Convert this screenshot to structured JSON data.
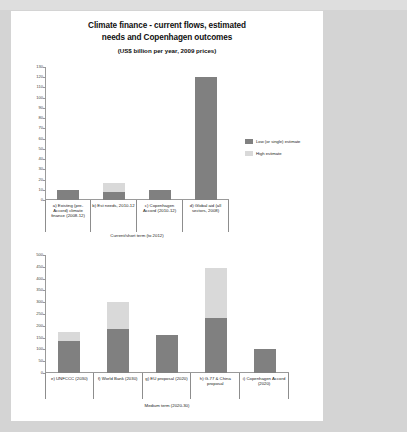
{
  "slide": {
    "title_lines": [
      "Climate finance - current flows, estimated",
      "needs and Copenhagen outcomes"
    ],
    "subtitle": "(US$ billion per year, 2009 prices)"
  },
  "legend": {
    "position": "right",
    "items": [
      {
        "label": "Low (or single) estimate",
        "color": "#808080"
      },
      {
        "label": "High estimate",
        "color": "#d9d9d9"
      }
    ]
  },
  "chart_data": [
    {
      "type": "bar",
      "id": "current-short-term",
      "title": "Climate finance - current flows, estimated needs and Copenhagen outcomes",
      "subtitle": "(US$ billion per year, 2009 prices)",
      "xlabel": "Current/short term (to 2012)",
      "ylabel": "",
      "ylim": [
        0,
        130
      ],
      "ytick_step": 10,
      "yticks": [
        0,
        10,
        20,
        30,
        40,
        50,
        60,
        70,
        80,
        90,
        100,
        110,
        120,
        130
      ],
      "grid": false,
      "stacked": true,
      "categories": [
        "a) Existing (pre-Accord) climate finance (2008-12)",
        "b) Est needs, 2010-12",
        "c) Copenhagen Accord (2010-12)",
        "d) Global aid (all sectors, 2008)"
      ],
      "series": [
        {
          "name": "Low (or single) estimate",
          "color": "#808080",
          "values": [
            10,
            8,
            10,
            120
          ]
        },
        {
          "name": "High estimate",
          "color": "#d9d9d9",
          "values": [
            0,
            9,
            0,
            0
          ]
        }
      ],
      "totals": [
        10,
        17,
        10,
        120
      ]
    },
    {
      "type": "bar",
      "id": "medium-term",
      "xlabel": "Medium term (2020-30)",
      "ylabel": "",
      "ylim": [
        0,
        500
      ],
      "ytick_step": 50,
      "yticks": [
        0,
        50,
        100,
        150,
        200,
        250,
        300,
        350,
        400,
        450,
        500
      ],
      "grid": false,
      "stacked": true,
      "categories": [
        "e) UNFCCC (2030)",
        "f) World Bank (2030)",
        "g) EU proposal (2020)",
        "h) G-77 & China proposal",
        "i) Copenhagen Accord (2020)"
      ],
      "series": [
        {
          "name": "Low (or single) estimate",
          "color": "#808080",
          "values": [
            135,
            185,
            160,
            235,
            100
          ]
        },
        {
          "name": "High estimate",
          "color": "#d9d9d9",
          "values": [
            40,
            115,
            0,
            210,
            0
          ]
        }
      ],
      "totals": [
        175,
        300,
        160,
        445,
        100
      ]
    }
  ]
}
